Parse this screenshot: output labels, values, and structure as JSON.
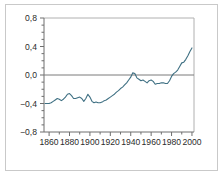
{
  "chart_data": {
    "type": "line",
    "title": "",
    "subtitle": "",
    "xlabel": "",
    "ylabel": "",
    "xlim": [
      1855,
      2002
    ],
    "ylim": [
      -0.8,
      0.8
    ],
    "grid": false,
    "legend": null,
    "zero_line": 0.0,
    "x_major_ticks": [
      1860,
      1880,
      1900,
      1920,
      1940,
      1960,
      1980,
      2000
    ],
    "x_minor_step": 10,
    "x_tick_labels": [
      "1860",
      "1880",
      "1900",
      "1920",
      "1940",
      "1960",
      "1980",
      "2000"
    ],
    "y_major_ticks": [
      -0.8,
      -0.4,
      0.0,
      0.4,
      0.8
    ],
    "y_tick_labels": [
      "−0,8",
      "−0,4",
      "0,0",
      "0,4",
      "0,8"
    ],
    "y_minor_step": 0.1,
    "series": [
      {
        "name": "temperature anomaly",
        "color": "#3f7083",
        "x": [
          1856,
          1858,
          1860,
          1862,
          1864,
          1866,
          1868,
          1870,
          1872,
          1874,
          1876,
          1878,
          1880,
          1882,
          1884,
          1886,
          1888,
          1890,
          1892,
          1894,
          1896,
          1898,
          1900,
          1902,
          1904,
          1906,
          1908,
          1910,
          1912,
          1914,
          1916,
          1918,
          1920,
          1922,
          1924,
          1926,
          1928,
          1930,
          1932,
          1934,
          1936,
          1938,
          1940,
          1942,
          1944,
          1946,
          1948,
          1950,
          1952,
          1954,
          1956,
          1958,
          1960,
          1962,
          1964,
          1966,
          1968,
          1970,
          1972,
          1974,
          1976,
          1978,
          1980,
          1982,
          1984,
          1986,
          1988,
          1990,
          1992,
          1994,
          1996,
          1998,
          2000
        ],
        "y": [
          -0.4,
          -0.4,
          -0.4,
          -0.39,
          -0.37,
          -0.35,
          -0.33,
          -0.34,
          -0.36,
          -0.34,
          -0.31,
          -0.27,
          -0.26,
          -0.29,
          -0.33,
          -0.33,
          -0.32,
          -0.31,
          -0.33,
          -0.37,
          -0.33,
          -0.27,
          -0.31,
          -0.37,
          -0.39,
          -0.38,
          -0.39,
          -0.39,
          -0.38,
          -0.36,
          -0.35,
          -0.33,
          -0.31,
          -0.29,
          -0.27,
          -0.24,
          -0.22,
          -0.19,
          -0.17,
          -0.14,
          -0.11,
          -0.07,
          -0.03,
          0.03,
          0.02,
          -0.04,
          -0.06,
          -0.08,
          -0.07,
          -0.09,
          -0.11,
          -0.08,
          -0.07,
          -0.09,
          -0.13,
          -0.12,
          -0.12,
          -0.11,
          -0.11,
          -0.12,
          -0.12,
          -0.08,
          -0.02,
          0.02,
          0.04,
          0.07,
          0.12,
          0.17,
          0.18,
          0.22,
          0.27,
          0.33,
          0.38
        ]
      }
    ]
  },
  "figure": {
    "frame_color": "#c9c9c9",
    "axis_color": "#6e6e6e",
    "zero_line_color": "#7a7a7a",
    "background": "#ffffff"
  }
}
